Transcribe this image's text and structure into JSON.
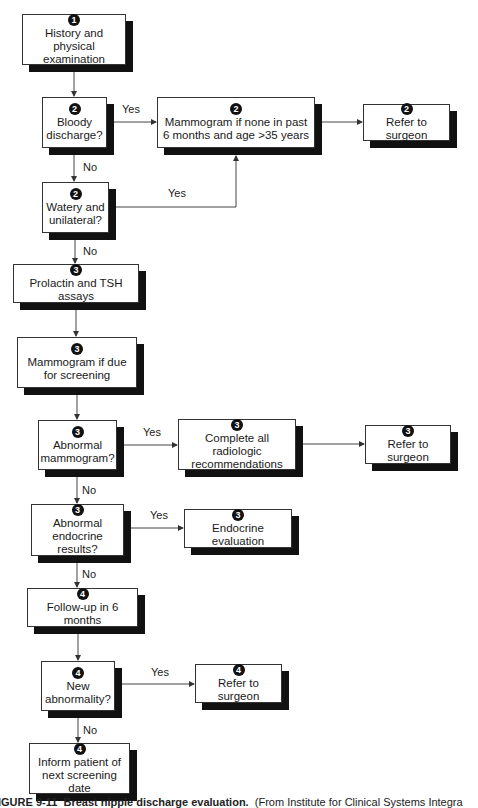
{
  "flowchart": {
    "nodes": {
      "history": {
        "step": "1",
        "text": "History and physical examination"
      },
      "bloody": {
        "step": "2",
        "text": "Bloody discharge?"
      },
      "mammo_none": {
        "step": "2",
        "text": "Mammogram if none in past 6 months and age >35 years"
      },
      "refer2": {
        "step": "2",
        "text": "Refer to surgeon"
      },
      "watery": {
        "step": "2",
        "text": "Watery and unilateral?"
      },
      "prolactin": {
        "step": "3",
        "text": "Prolactin and TSH assays"
      },
      "mammo_due": {
        "step": "3",
        "text": "Mammogram if due for screening"
      },
      "abn_mammo": {
        "step": "3",
        "text": "Abnormal mammogram?"
      },
      "radiologic": {
        "step": "3",
        "text": "Complete all radiologic recommendations"
      },
      "refer3": {
        "step": "3",
        "text": "Refer to surgeon"
      },
      "abn_endo": {
        "step": "3",
        "text": "Abnormal endocrine results?"
      },
      "endo_eval": {
        "step": "3",
        "text": "Endocrine evaluation"
      },
      "followup": {
        "step": "4",
        "text": "Follow-up in 6 months"
      },
      "new_abn": {
        "step": "4",
        "text": "New abnormality?"
      },
      "refer4": {
        "step": "4",
        "text": "Refer to surgeon"
      },
      "inform": {
        "step": "4",
        "text": "Inform patient of next screening date"
      }
    },
    "edge_labels": {
      "yes": "Yes",
      "no": "No"
    }
  },
  "caption": {
    "figure": "IGURE 9-11",
    "title": "Breast nipple discharge evaluation.",
    "source": "(From Institute for Clinical Systems Integra"
  }
}
